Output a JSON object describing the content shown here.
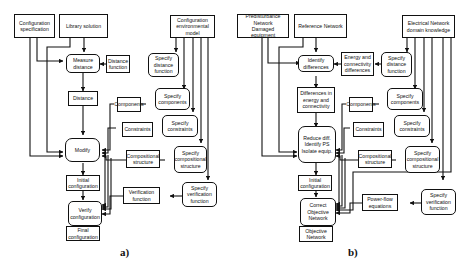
{
  "figure": {
    "panels": [
      {
        "id": "a",
        "label": "a)",
        "nodes": {
          "config_spec": "Configuration\nspecification",
          "library_solution": "Library solution",
          "config_env_model": "Configuration\nenvironmental model",
          "measure_distance": "Measure\ndistance",
          "distance_function": "Distance\nfunction",
          "specify_distance_function": "Specify\ndistance\nfunction",
          "distance": "Distance",
          "components": "Components",
          "specify_components": "Specify\ncomponents",
          "constraints": "Constraints",
          "specify_constraints": "Specify\nconstraints",
          "modify": "Modify",
          "compositional_structure": "Compositional\nstructure",
          "specify_compositional_structure": "Specify\ncompositional\nstructure",
          "initial_configuration": "Initial\nconfiguration",
          "verify_configuration": "Verify\nconfiguration",
          "verification_function": "Verification\nfunction",
          "specify_verification_function": "Specify\nverification\nfunction",
          "final_configuration": "Final\nconfiguration"
        }
      },
      {
        "id": "b",
        "label": "b)",
        "nodes": {
          "predisturbance_network": "Predisturbance Network\nDamaged equipment",
          "reference_network": "Reference Network",
          "electrical_network_knowledge": "Electrical Network\ndomain knowledge",
          "identify_differences": "Identify\ndifferences",
          "energy_connectivity_differences": "Energy and\nconnectivity\ndifferences",
          "specify_distance_function": "Specify\ndistance\nfunction",
          "differences_energy_connectivity": "Differences in\nenergy and\nconnectivity",
          "components": "Components",
          "specify_components": "Specify\ncomponents",
          "reduce_diff": "Reduce diff.\nIdentify PS\nIsolate equip.",
          "constraints": "Constraints",
          "specify_constraints": "Specify\nconstraints",
          "compositional_structure": "Compositional\nstructure",
          "specify_compositional_structure": "Specify\ncompositional\nstructure",
          "initial_configuration": "Initial\nconfiguration",
          "correct_objective_network": "Correct\nObjective\nNetwork",
          "power_flow_equations": "Power-flow\nequations",
          "specify_verification_function": "Specify\nverification\nfunction",
          "objective_network": "Objective\nNetwork"
        }
      }
    ],
    "colors": {
      "ink": "#111111",
      "background": "#ffffff"
    }
  }
}
